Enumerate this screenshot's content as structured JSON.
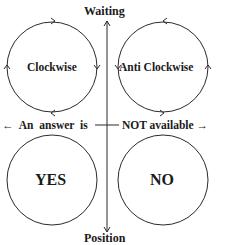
{
  "diagram": {
    "axis": {
      "top_label": "Waiting",
      "bottom_label": "Position"
    },
    "top_circles": [
      {
        "label": "Clockwise",
        "direction": "clockwise"
      },
      {
        "label": "Anti Clockwise",
        "direction": "anticlockwise"
      }
    ],
    "middle_row": {
      "left_text": "← An answer is",
      "right_text": "NOT available →"
    },
    "bottom_circles": [
      {
        "label": "YES"
      },
      {
        "label": "NO"
      }
    ],
    "colors": {
      "stroke": "#2a2a2a",
      "text": "#1a1a1a",
      "background": "#ffffff"
    }
  }
}
